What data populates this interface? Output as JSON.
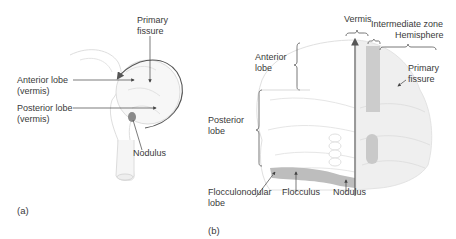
{
  "panel_a": {
    "tag": "(a)",
    "labels": {
      "primary_fissure": "Primary\nfissure",
      "anterior_lobe": "Anterior lobe\n(vermis)",
      "posterior_lobe": "Posterior lobe\n(vermis)",
      "nodulus": "Nodulus"
    }
  },
  "panel_b": {
    "tag": "(b)",
    "labels": {
      "vermis": "Vermis",
      "intermediate_zone": "Intermediate zone",
      "hemisphere": "Hemisphere",
      "anterior_lobe": "Anterior\nlobe",
      "primary_fissure": "Primary\nfissure",
      "posterior_lobe": "Posterior\nlobe",
      "flocculonodular_lobe": "Flocculonodular\nlobe",
      "flocculus": "Flocculus",
      "nodulus": "Nodulus"
    }
  },
  "colors": {
    "outline": "#d9d9d9",
    "fill_light": "#efefef",
    "fill_mid": "#c8c8c8",
    "fill_dark": "#9a9a9a",
    "arrow": "#444444"
  }
}
